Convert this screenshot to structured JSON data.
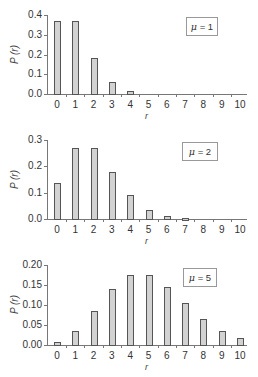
{
  "chart_data": [
    {
      "type": "bar",
      "title": "",
      "legend": "μ = 1",
      "xlabel": "r",
      "ylabel": "P (r)",
      "categories": [
        "0",
        "1",
        "2",
        "3",
        "4",
        "5",
        "6",
        "7",
        "8",
        "9",
        "10"
      ],
      "values": [
        0.368,
        0.368,
        0.184,
        0.061,
        0.015,
        0.003,
        0.0005,
        0.0001,
        0.0,
        0.0,
        0.0
      ],
      "ylim": [
        0,
        0.4
      ],
      "yticks": [
        "0.0",
        "0.1",
        "0.2",
        "0.3",
        "0.4"
      ],
      "grid": false,
      "legend_position": "upper right"
    },
    {
      "type": "bar",
      "title": "",
      "legend": "μ = 2",
      "xlabel": "r",
      "ylabel": "P (r)",
      "categories": [
        "0",
        "1",
        "2",
        "3",
        "4",
        "5",
        "6",
        "7",
        "8",
        "9",
        "10"
      ],
      "values": [
        0.135,
        0.271,
        0.271,
        0.18,
        0.09,
        0.036,
        0.012,
        0.003,
        0.0009,
        0.0002,
        4e-05
      ],
      "ylim": [
        0,
        0.3
      ],
      "yticks": [
        "0.0",
        "0.1",
        "0.2",
        "0.3"
      ],
      "grid": false,
      "legend_position": "upper right"
    },
    {
      "type": "bar",
      "title": "",
      "legend": "μ = 5",
      "xlabel": "r",
      "ylabel": "P (r)",
      "categories": [
        "0",
        "1",
        "2",
        "3",
        "4",
        "5",
        "6",
        "7",
        "8",
        "9",
        "10"
      ],
      "values": [
        0.0067,
        0.034,
        0.084,
        0.14,
        0.175,
        0.175,
        0.146,
        0.104,
        0.065,
        0.036,
        0.018
      ],
      "ylim": [
        0,
        0.2
      ],
      "yticks": [
        "0.00",
        "0.05",
        "0.10",
        "0.15",
        "0.20"
      ],
      "grid": false,
      "legend_position": "upper right"
    }
  ],
  "panels": [
    {
      "legend_mu": "μ",
      "legend_eq": " = 1",
      "ylabel": "P (r)",
      "xlabel": "r"
    },
    {
      "legend_mu": "μ",
      "legend_eq": " = 2",
      "ylabel": "P (r)",
      "xlabel": "r"
    },
    {
      "legend_mu": "μ",
      "legend_eq": " = 5",
      "ylabel": "P (r)",
      "xlabel": "r"
    }
  ]
}
